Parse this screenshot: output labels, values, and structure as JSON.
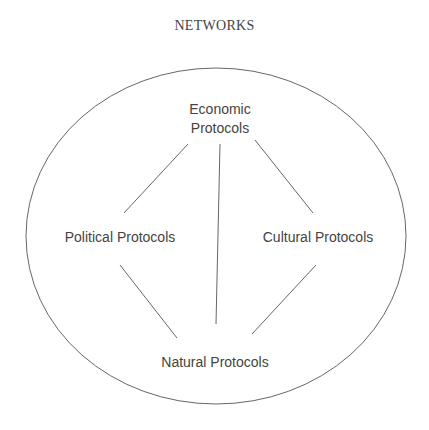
{
  "title": "NETWORKS",
  "nodes": {
    "economic": {
      "line1": "Economic",
      "line2": "Protocols"
    },
    "political": {
      "label": "Political Protocols"
    },
    "cultural": {
      "label": "Cultural Protocols"
    },
    "natural": {
      "label": "Natural Protocols"
    }
  },
  "edges": [
    {
      "from": "Economic Protocols",
      "to": "Political Protocols"
    },
    {
      "from": "Economic Protocols",
      "to": "Natural Protocols"
    },
    {
      "from": "Economic Protocols",
      "to": "Cultural Protocols"
    },
    {
      "from": "Political Protocols",
      "to": "Natural Protocols"
    },
    {
      "from": "Cultural Protocols",
      "to": "Natural Protocols"
    }
  ],
  "colors": {
    "stroke": "#555555",
    "text": "#444444"
  }
}
